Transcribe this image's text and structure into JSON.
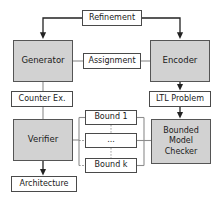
{
  "diagram": {
    "type": "flow-diagram",
    "background_color": "#ffffff",
    "shaded_fill": "#d2d2d2",
    "plain_fill": "#ffffff",
    "border_color": "#4a4a4a",
    "text_color": "#1a1a1a",
    "nodes": [
      {
        "id": "refinement",
        "label": "Refinement",
        "style": "plain",
        "x": 82,
        "y": 10,
        "w": 60,
        "h": 16
      },
      {
        "id": "generator",
        "label": "Generator",
        "style": "shaded",
        "x": 13,
        "y": 40,
        "w": 60,
        "h": 42
      },
      {
        "id": "assignment",
        "label": "Assignment",
        "style": "plain",
        "x": 83,
        "y": 53,
        "w": 58,
        "h": 16
      },
      {
        "id": "encoder",
        "label": "Encoder",
        "style": "shaded",
        "x": 150,
        "y": 40,
        "w": 60,
        "h": 42
      },
      {
        "id": "counterex",
        "label": "Counter Ex.",
        "style": "plain",
        "x": 11,
        "y": 91,
        "w": 62,
        "h": 16
      },
      {
        "id": "ltlproblem",
        "label": "LTL Problem",
        "style": "plain",
        "x": 149,
        "y": 91,
        "w": 62,
        "h": 16
      },
      {
        "id": "verifier",
        "label": "Verifier",
        "style": "shaded",
        "x": 13,
        "y": 119,
        "w": 60,
        "h": 42
      },
      {
        "id": "bound1",
        "label": "Bound 1",
        "style": "plain",
        "x": 85,
        "y": 110,
        "w": 52,
        "h": 15
      },
      {
        "id": "bounddots",
        "label": "...",
        "style": "plain",
        "x": 85,
        "y": 133,
        "w": 52,
        "h": 15
      },
      {
        "id": "boundk",
        "label": "Bound k",
        "style": "plain",
        "x": 85,
        "y": 158,
        "w": 52,
        "h": 15
      },
      {
        "id": "bmc",
        "label": "Bounded\nModel\nChecker",
        "style": "shaded",
        "x": 151,
        "y": 119,
        "w": 60,
        "h": 45
      },
      {
        "id": "architecture",
        "label": "Architecture",
        "style": "plain",
        "x": 11,
        "y": 176,
        "w": 66,
        "h": 16
      }
    ],
    "labels": {
      "refinement": "Refinement",
      "generator": "Generator",
      "assignment": "Assignment",
      "encoder": "Encoder",
      "counterex": "Counter Ex.",
      "ltlproblem": "LTL Problem",
      "verifier": "Verifier",
      "bound1": "Bound 1",
      "bounddots": "...",
      "boundk": "Bound k",
      "bmc_line1": "Bounded",
      "bmc_line2": "Model",
      "bmc_line3": "Checker",
      "architecture": "Architecture"
    },
    "edges": [
      {
        "from": "refinement",
        "to": "generator",
        "kind": "arrow",
        "routing": "left-then-down"
      },
      {
        "from": "refinement",
        "to": "encoder",
        "kind": "arrow",
        "routing": "right-then-down"
      },
      {
        "from": "generator",
        "to": "assignment",
        "kind": "line",
        "routing": "horizontal"
      },
      {
        "from": "assignment",
        "to": "encoder",
        "kind": "line",
        "routing": "horizontal"
      },
      {
        "from": "generator",
        "to": "counterex",
        "kind": "line",
        "routing": "vertical"
      },
      {
        "from": "counterex",
        "to": "verifier",
        "kind": "line",
        "routing": "vertical"
      },
      {
        "from": "encoder",
        "to": "ltlproblem",
        "kind": "arrow",
        "routing": "vertical"
      },
      {
        "from": "ltlproblem",
        "to": "bmc",
        "kind": "arrow",
        "routing": "vertical"
      },
      {
        "from": "verifier",
        "to": "bounds-bus",
        "kind": "line",
        "routing": "bus-left"
      },
      {
        "from": "bmc",
        "to": "bounds-bus",
        "kind": "line",
        "routing": "bus-right"
      },
      {
        "from": "verifier",
        "to": "architecture",
        "kind": "arrow",
        "routing": "vertical"
      }
    ]
  }
}
